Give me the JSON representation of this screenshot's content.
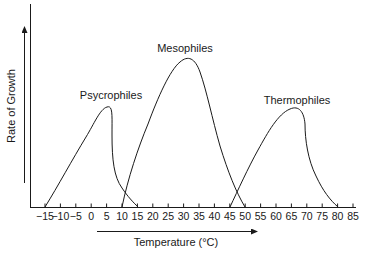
{
  "chart_data": {
    "type": "line",
    "title": "",
    "xlabel": "Temperature (°C)",
    "ylabel": "Rate of Growth",
    "xlim": [
      -15,
      85
    ],
    "ylim": [
      0,
      1
    ],
    "x_ticks": [
      -15,
      -10,
      -5,
      0,
      5,
      10,
      15,
      20,
      25,
      30,
      35,
      40,
      45,
      50,
      55,
      60,
      65,
      70,
      75,
      80,
      85
    ],
    "x_tick_labels": [
      "−15",
      "−10",
      "−5",
      "0",
      "5",
      "10",
      "15",
      "20",
      "25",
      "30",
      "35",
      "40",
      "45",
      "50",
      "55",
      "60",
      "65",
      "70",
      "75",
      "80",
      "85"
    ],
    "y_ticks": [],
    "grid": false,
    "legend": "none (curves labeled directly)",
    "series": [
      {
        "name": "Psycrophiles",
        "minimum": -15,
        "optimum": 5,
        "maximum": 15,
        "relative_peak": 0.66,
        "points": [
          [
            -15,
            0
          ],
          [
            -10,
            0.16
          ],
          [
            -5,
            0.36
          ],
          [
            0,
            0.56
          ],
          [
            3,
            0.65
          ],
          [
            5,
            0.66
          ],
          [
            6,
            0.6
          ],
          [
            6.5,
            0.3
          ],
          [
            9,
            0.12
          ],
          [
            12,
            0.05
          ],
          [
            15,
            0
          ]
        ]
      },
      {
        "name": "Mesophiles",
        "minimum": 10,
        "optimum": 30,
        "maximum": 50,
        "relative_peak": 1.0,
        "points": [
          [
            10,
            0
          ],
          [
            15,
            0.42
          ],
          [
            20,
            0.73
          ],
          [
            25,
            0.93
          ],
          [
            30,
            1.0
          ],
          [
            33,
            0.96
          ],
          [
            35,
            0.78
          ],
          [
            40,
            0.42
          ],
          [
            45,
            0.14
          ],
          [
            50,
            0
          ]
        ]
      },
      {
        "name": "Thermophiles",
        "minimum": 45,
        "optimum": 65,
        "maximum": 80,
        "relative_peak": 0.65,
        "points": [
          [
            45,
            0
          ],
          [
            50,
            0.24
          ],
          [
            55,
            0.46
          ],
          [
            60,
            0.6
          ],
          [
            65,
            0.65
          ],
          [
            68,
            0.6
          ],
          [
            69,
            0.45
          ],
          [
            72,
            0.24
          ],
          [
            76,
            0.08
          ],
          [
            80,
            0
          ]
        ]
      }
    ],
    "annotations": [
      {
        "text": "Psycrophiles",
        "near_x": 5
      },
      {
        "text": "Mesophiles",
        "near_x": 30
      },
      {
        "text": "Thermophiles",
        "near_x": 65
      }
    ],
    "arrows": [
      {
        "direction": "up",
        "meaning": "increasing rate of growth"
      },
      {
        "direction": "right",
        "meaning": "increasing temperature"
      }
    ]
  },
  "labels": {
    "ylabel": "Rate of Growth",
    "xlabel": "Temperature (°C)",
    "psycrophiles": "Psycrophiles",
    "mesophiles": "Mesophiles",
    "thermophiles": "Thermophiles"
  },
  "colors": {
    "line": "#1a1a1a",
    "background": "#ffffff"
  }
}
